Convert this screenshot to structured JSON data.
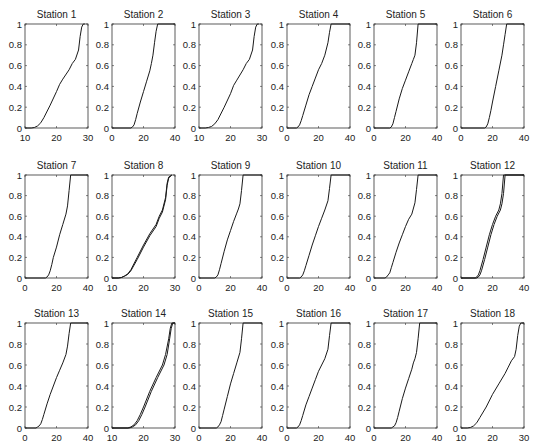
{
  "figure": {
    "layout": {
      "rows": 3,
      "cols": 6
    },
    "y_ticks": [
      0,
      0.2,
      0.4,
      0.6,
      0.8,
      1
    ],
    "y_tick_labels": [
      "0",
      "0.2",
      "0.4",
      "0.6",
      "0.8",
      "1"
    ],
    "line_color": "#1a1a1a",
    "axes_color": "#333333"
  },
  "chart_data": [
    {
      "type": "line",
      "title": "Station 1",
      "xlim": [
        10,
        30
      ],
      "ylim": [
        0,
        1
      ],
      "xticks": [
        10,
        20,
        30
      ],
      "series": [
        {
          "name": "cdf",
          "x": [
            10,
            12,
            13,
            14,
            15,
            16,
            18,
            20,
            21,
            22,
            24,
            25,
            26,
            27,
            27.5,
            28,
            28.5,
            29
          ],
          "y": [
            0,
            0,
            0.005,
            0.02,
            0.05,
            0.1,
            0.22,
            0.35,
            0.42,
            0.47,
            0.56,
            0.62,
            0.66,
            0.75,
            0.88,
            0.97,
            1,
            1
          ]
        }
      ]
    },
    {
      "type": "line",
      "title": "Station 2",
      "xlim": [
        0,
        40
      ],
      "ylim": [
        0,
        1
      ],
      "xticks": [
        0,
        20,
        40
      ],
      "series": [
        {
          "name": "cdf",
          "x": [
            0,
            12,
            13,
            14,
            15,
            16,
            18,
            20,
            22,
            24,
            25,
            26,
            27,
            28,
            29,
            40
          ],
          "y": [
            0,
            0,
            0.01,
            0.03,
            0.08,
            0.14,
            0.25,
            0.35,
            0.45,
            0.55,
            0.62,
            0.7,
            0.82,
            0.93,
            1,
            1
          ]
        }
      ]
    },
    {
      "type": "line",
      "title": "Station 3",
      "xlim": [
        10,
        30
      ],
      "ylim": [
        0,
        1
      ],
      "xticks": [
        10,
        20,
        30
      ],
      "series": [
        {
          "name": "cdf",
          "x": [
            10,
            12,
            13,
            14,
            15,
            16,
            18,
            20,
            21,
            22,
            24,
            25,
            26,
            27,
            27.5,
            28,
            28.5,
            29
          ],
          "y": [
            0,
            0,
            0.005,
            0.015,
            0.04,
            0.08,
            0.2,
            0.33,
            0.41,
            0.46,
            0.56,
            0.62,
            0.66,
            0.75,
            0.88,
            0.97,
            1,
            1
          ]
        }
      ]
    },
    {
      "type": "line",
      "title": "Station 4",
      "xlim": [
        0,
        40
      ],
      "ylim": [
        0,
        1
      ],
      "xticks": [
        0,
        20,
        40
      ],
      "series": [
        {
          "name": "cdf",
          "x": [
            0,
            6,
            7,
            8,
            9,
            10,
            12,
            14,
            16,
            18,
            20,
            22,
            24,
            26,
            27,
            28,
            40
          ],
          "y": [
            0,
            0,
            0.01,
            0.03,
            0.07,
            0.12,
            0.22,
            0.32,
            0.4,
            0.48,
            0.56,
            0.62,
            0.7,
            0.82,
            0.92,
            1,
            1
          ]
        }
      ]
    },
    {
      "type": "line",
      "title": "Station 5",
      "xlim": [
        0,
        40
      ],
      "ylim": [
        0,
        1
      ],
      "xticks": [
        0,
        20,
        40
      ],
      "series": [
        {
          "name": "cdf",
          "x": [
            0,
            10,
            11,
            12,
            13,
            14,
            16,
            18,
            20,
            22,
            24,
            25,
            26,
            27,
            28,
            40
          ],
          "y": [
            0,
            0,
            0.01,
            0.04,
            0.1,
            0.16,
            0.28,
            0.38,
            0.46,
            0.54,
            0.62,
            0.66,
            0.7,
            0.82,
            1,
            1
          ]
        }
      ]
    },
    {
      "type": "line",
      "title": "Station 6",
      "xlim": [
        0,
        40
      ],
      "ylim": [
        0,
        1
      ],
      "xticks": [
        0,
        20,
        40
      ],
      "series": [
        {
          "name": "cdf",
          "x": [
            0,
            15,
            16,
            17,
            18,
            19,
            20,
            22,
            24,
            26,
            27,
            28,
            29,
            40
          ],
          "y": [
            0,
            0,
            0.01,
            0.04,
            0.1,
            0.17,
            0.25,
            0.4,
            0.55,
            0.7,
            0.8,
            0.9,
            1,
            1
          ]
        }
      ]
    },
    {
      "type": "line",
      "title": "Station 7",
      "xlim": [
        0,
        40
      ],
      "ylim": [
        0,
        1
      ],
      "xticks": [
        0,
        20,
        40
      ],
      "series": [
        {
          "name": "cdf",
          "x": [
            0,
            13,
            14,
            15,
            16,
            17,
            18,
            20,
            22,
            24,
            26,
            27,
            28,
            29,
            40
          ],
          "y": [
            0,
            0,
            0.01,
            0.03,
            0.07,
            0.13,
            0.2,
            0.3,
            0.42,
            0.52,
            0.62,
            0.7,
            0.85,
            1,
            1
          ]
        }
      ]
    },
    {
      "type": "line",
      "title": "Station 8",
      "xlim": [
        10,
        30
      ],
      "ylim": [
        0,
        1
      ],
      "xticks": [
        10,
        20,
        30
      ],
      "series": [
        {
          "name": "cdf-a",
          "x": [
            10,
            12,
            13,
            14,
            15,
            16,
            18,
            20,
            22,
            24,
            25,
            26,
            27,
            27.5,
            28,
            29
          ],
          "y": [
            0,
            0,
            0.005,
            0.02,
            0.04,
            0.08,
            0.2,
            0.32,
            0.43,
            0.52,
            0.6,
            0.66,
            0.78,
            0.92,
            0.98,
            1
          ]
        },
        {
          "name": "cdf-b",
          "x": [
            10,
            12,
            13,
            14,
            15,
            16,
            18,
            20,
            22,
            24,
            25,
            26,
            27,
            27.5,
            28,
            29
          ],
          "y": [
            0,
            0,
            0.005,
            0.018,
            0.035,
            0.07,
            0.18,
            0.3,
            0.41,
            0.5,
            0.58,
            0.64,
            0.76,
            0.9,
            0.97,
            1
          ]
        }
      ]
    },
    {
      "type": "line",
      "title": "Station 9",
      "xlim": [
        0,
        40
      ],
      "ylim": [
        0,
        1
      ],
      "xticks": [
        0,
        20,
        40
      ],
      "series": [
        {
          "name": "cdf",
          "x": [
            0,
            10,
            11,
            12,
            13,
            14,
            16,
            18,
            20,
            22,
            24,
            25,
            26,
            27,
            28,
            40
          ],
          "y": [
            0,
            0,
            0.01,
            0.03,
            0.08,
            0.14,
            0.26,
            0.37,
            0.46,
            0.55,
            0.63,
            0.67,
            0.72,
            0.85,
            1,
            1
          ]
        }
      ]
    },
    {
      "type": "line",
      "title": "Station 10",
      "xlim": [
        0,
        40
      ],
      "ylim": [
        0,
        1
      ],
      "xticks": [
        0,
        20,
        40
      ],
      "series": [
        {
          "name": "cdf",
          "x": [
            0,
            8,
            9,
            10,
            11,
            12,
            14,
            16,
            18,
            20,
            22,
            24,
            26,
            27,
            28,
            40
          ],
          "y": [
            0,
            0,
            0.01,
            0.03,
            0.07,
            0.12,
            0.22,
            0.32,
            0.41,
            0.5,
            0.58,
            0.66,
            0.75,
            0.87,
            1,
            1
          ]
        }
      ]
    },
    {
      "type": "line",
      "title": "Station 11",
      "xlim": [
        0,
        40
      ],
      "ylim": [
        0,
        1
      ],
      "xticks": [
        0,
        20,
        40
      ],
      "series": [
        {
          "name": "cdf",
          "x": [
            0,
            7,
            8,
            9,
            10,
            11,
            12,
            14,
            16,
            18,
            20,
            22,
            24,
            26,
            27,
            28,
            40
          ],
          "y": [
            0,
            0,
            0.01,
            0.03,
            0.05,
            0.1,
            0.15,
            0.25,
            0.34,
            0.42,
            0.5,
            0.57,
            0.62,
            0.73,
            0.86,
            1,
            1
          ]
        }
      ]
    },
    {
      "type": "line",
      "title": "Station 12",
      "xlim": [
        0,
        40
      ],
      "ylim": [
        0,
        1
      ],
      "xticks": [
        0,
        20,
        40
      ],
      "series": [
        {
          "name": "cdf-a",
          "x": [
            0,
            9,
            10,
            11,
            12,
            14,
            16,
            18,
            20,
            22,
            24,
            25,
            26,
            27,
            40
          ],
          "y": [
            0,
            0,
            0.01,
            0.03,
            0.07,
            0.18,
            0.3,
            0.42,
            0.52,
            0.6,
            0.66,
            0.72,
            0.82,
            1,
            1
          ]
        },
        {
          "name": "cdf-b",
          "x": [
            0,
            10,
            11,
            12,
            13,
            15,
            17,
            19,
            21,
            23,
            25,
            26,
            27,
            28,
            40
          ],
          "y": [
            0,
            0,
            0.01,
            0.03,
            0.07,
            0.18,
            0.3,
            0.42,
            0.52,
            0.6,
            0.66,
            0.72,
            0.82,
            1,
            1
          ]
        }
      ]
    },
    {
      "type": "line",
      "title": "Station 13",
      "xlim": [
        0,
        40
      ],
      "ylim": [
        0,
        1
      ],
      "xticks": [
        0,
        20,
        40
      ],
      "series": [
        {
          "name": "cdf",
          "x": [
            0,
            7,
            8,
            9,
            10,
            11,
            12,
            14,
            16,
            18,
            20,
            22,
            24,
            26,
            27,
            28,
            29,
            40
          ],
          "y": [
            0,
            0,
            0.01,
            0.02,
            0.04,
            0.08,
            0.13,
            0.23,
            0.32,
            0.4,
            0.48,
            0.55,
            0.62,
            0.7,
            0.78,
            0.9,
            1,
            1
          ]
        }
      ]
    },
    {
      "type": "line",
      "title": "Station 14",
      "xlim": [
        10,
        30
      ],
      "ylim": [
        0,
        1
      ],
      "xticks": [
        10,
        20,
        30
      ],
      "series": [
        {
          "name": "cdf-a",
          "x": [
            10,
            15,
            16,
            17,
            18,
            19,
            20,
            22,
            24,
            26,
            27,
            28,
            28.5,
            29,
            30
          ],
          "y": [
            0,
            0,
            0.01,
            0.03,
            0.07,
            0.13,
            0.2,
            0.35,
            0.48,
            0.6,
            0.7,
            0.85,
            0.95,
            1,
            1
          ]
        },
        {
          "name": "cdf-b",
          "x": [
            10,
            15.5,
            16.5,
            17.5,
            18.5,
            19.5,
            20.5,
            22.5,
            24.5,
            26.5,
            27.5,
            28.3,
            28.8,
            29.3,
            30
          ],
          "y": [
            0,
            0,
            0.01,
            0.03,
            0.07,
            0.13,
            0.2,
            0.35,
            0.48,
            0.6,
            0.7,
            0.85,
            0.95,
            1,
            1
          ]
        }
      ]
    },
    {
      "type": "line",
      "title": "Station 15",
      "xlim": [
        0,
        40
      ],
      "ylim": [
        0,
        1
      ],
      "xticks": [
        0,
        20,
        40
      ],
      "series": [
        {
          "name": "cdf",
          "x": [
            0,
            11,
            12,
            13,
            14,
            15,
            16,
            18,
            20,
            22,
            24,
            26,
            27,
            28,
            40
          ],
          "y": [
            0,
            0,
            0.01,
            0.03,
            0.06,
            0.12,
            0.18,
            0.3,
            0.42,
            0.52,
            0.62,
            0.72,
            0.85,
            1,
            1
          ]
        }
      ]
    },
    {
      "type": "line",
      "title": "Station 16",
      "xlim": [
        0,
        40
      ],
      "ylim": [
        0,
        1
      ],
      "xticks": [
        0,
        20,
        40
      ],
      "series": [
        {
          "name": "cdf",
          "x": [
            0,
            6,
            7,
            8,
            9,
            10,
            12,
            14,
            16,
            18,
            20,
            22,
            24,
            26,
            27,
            28,
            40
          ],
          "y": [
            0,
            0,
            0.01,
            0.03,
            0.07,
            0.12,
            0.22,
            0.3,
            0.38,
            0.46,
            0.54,
            0.6,
            0.66,
            0.75,
            0.88,
            1,
            1
          ]
        }
      ]
    },
    {
      "type": "line",
      "title": "Station 17",
      "xlim": [
        0,
        40
      ],
      "ylim": [
        0,
        1
      ],
      "xticks": [
        0,
        20,
        40
      ],
      "series": [
        {
          "name": "cdf",
          "x": [
            0,
            11,
            12,
            13,
            14,
            15,
            16,
            18,
            20,
            22,
            24,
            25,
            26,
            27,
            28,
            29,
            40
          ],
          "y": [
            0,
            0,
            0.01,
            0.02,
            0.05,
            0.1,
            0.16,
            0.28,
            0.38,
            0.47,
            0.56,
            0.62,
            0.66,
            0.72,
            0.85,
            1,
            1
          ]
        }
      ]
    },
    {
      "type": "line",
      "title": "Station 18",
      "xlim": [
        10,
        30
      ],
      "ylim": [
        0,
        1
      ],
      "xticks": [
        10,
        20,
        30
      ],
      "series": [
        {
          "name": "cdf",
          "x": [
            10,
            12,
            13,
            14,
            15,
            16,
            18,
            20,
            22,
            24,
            25,
            26,
            27,
            27.5,
            28,
            28.5,
            29,
            30
          ],
          "y": [
            0,
            0,
            0.005,
            0.02,
            0.05,
            0.1,
            0.2,
            0.32,
            0.42,
            0.52,
            0.58,
            0.64,
            0.68,
            0.75,
            0.88,
            0.97,
            1,
            1
          ]
        }
      ]
    }
  ]
}
